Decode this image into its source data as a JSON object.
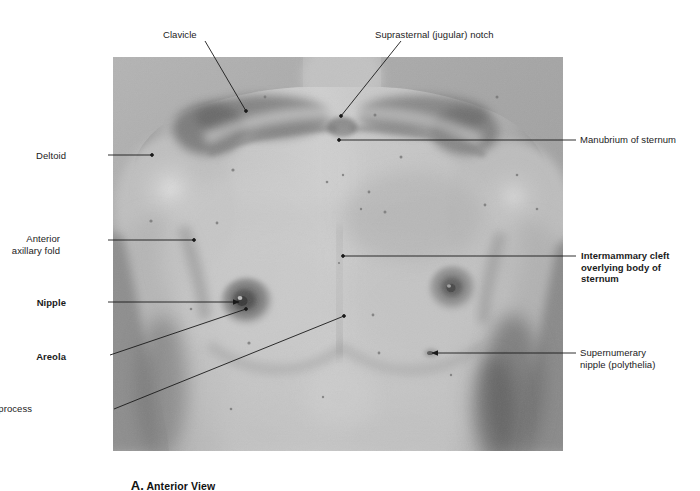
{
  "figure": {
    "caption_letter": "A.",
    "caption_text": " Anterior View",
    "photo_alt": "black-and-white anterior view photograph of a male chest and thorax"
  },
  "colors": {
    "text": "#1b1b1b",
    "leader_line": "#1a1a1a",
    "photo_background": "#a9a9a9",
    "page_background": "#ffffff"
  },
  "labels": [
    {
      "id": "clavicle",
      "text": "Clavicle",
      "bold": false,
      "align": "left",
      "x": 163,
      "y": 29,
      "leader": {
        "type": "line",
        "x1": 205,
        "y1": 41,
        "x2": 246,
        "y2": 111,
        "arrow": false
      }
    },
    {
      "id": "suprasternal-notch",
      "text": "Suprasternal (jugular) notch",
      "bold": false,
      "align": "left",
      "x": 375,
      "y": 29,
      "leader": {
        "type": "line",
        "x1": 401,
        "y1": 41,
        "x2": 341,
        "y2": 116,
        "arrow": false
      }
    },
    {
      "id": "deltoid",
      "text": "Deltoid",
      "bold": false,
      "align": "right",
      "x": 66,
      "y": 150,
      "leader": {
        "type": "line",
        "x1": 108,
        "y1": 155,
        "x2": 152,
        "y2": 155,
        "arrow": false
      }
    },
    {
      "id": "manubrium-of-sternum",
      "text": "Manubrium of sternum",
      "bold": false,
      "align": "left",
      "x": 580,
      "y": 134,
      "leader": {
        "type": "line",
        "x1": 576,
        "y1": 140,
        "x2": 339,
        "y2": 140,
        "arrow": false
      }
    },
    {
      "id": "anterior-axillary-fold",
      "text": "Anterior\naxillary fold",
      "bold": false,
      "align": "right",
      "x": 60,
      "y": 233,
      "leader": {
        "type": "line",
        "x1": 108,
        "y1": 240,
        "x2": 194,
        "y2": 240,
        "arrow": false
      }
    },
    {
      "id": "intermammary-cleft",
      "text": "Intermammary cleft\noverlying body of\nsternum",
      "bold": true,
      "align": "left",
      "x": 581,
      "y": 250,
      "leader": {
        "type": "line",
        "x1": 576,
        "y1": 256,
        "x2": 343,
        "y2": 256,
        "arrow": false
      }
    },
    {
      "id": "nipple",
      "text": "Nipple",
      "bold": true,
      "align": "right",
      "x": 66,
      "y": 297,
      "leader": {
        "type": "line",
        "x1": 108,
        "y1": 302,
        "x2": 239,
        "y2": 302,
        "arrow": true
      }
    },
    {
      "id": "areola",
      "text": "Areola",
      "bold": true,
      "align": "right",
      "x": 66,
      "y": 351,
      "leader": {
        "type": "line",
        "x1": 110,
        "y1": 355,
        "x2": 246,
        "y2": 309,
        "arrow": false
      }
    },
    {
      "id": "supernumerary-nipple",
      "text": "Supernumerary\nnipple (polythelia)",
      "bold": false,
      "align": "left",
      "x": 580,
      "y": 347,
      "leader": {
        "type": "line",
        "x1": 576,
        "y1": 353,
        "x2": 432,
        "y2": 353,
        "arrow": true
      }
    },
    {
      "id": "xiphoid-process",
      "text": "Xiphoid process",
      "bold": false,
      "align": "right",
      "x": 32,
      "y": 403,
      "leader": {
        "type": "line",
        "x1": 114,
        "y1": 409,
        "x2": 344,
        "y2": 316,
        "arrow": false
      }
    }
  ]
}
